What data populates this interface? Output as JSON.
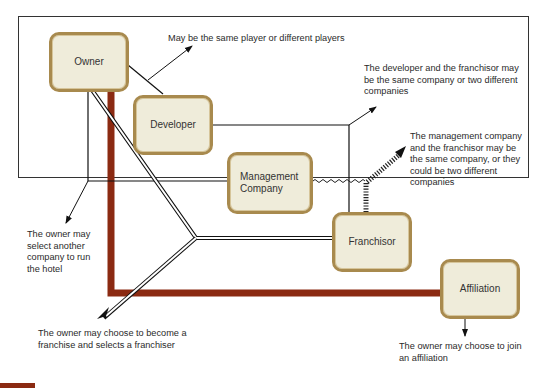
{
  "diagram": {
    "nodes": {
      "owner": "Owner",
      "developer": "Developer",
      "management": "Management Company",
      "franchisor": "Franchisor",
      "affiliation": "Affiliation"
    },
    "notes": {
      "same_player": "May be the same player or different players",
      "developer_franchisor": "The developer and the franchisor may be the same company or two different companies",
      "management_franchisor": "The management company and the franchisor may be the same company, or they could be two different companies",
      "select_company": "The owner may select another company to run the hotel",
      "franchise": "The owner may choose to become a franchise and selects a franchiser",
      "affiliation": "The owner may choose to join an affiliation"
    },
    "colors": {
      "node_fill": "#efecda",
      "node_border": "#a88a4e",
      "affiliation_path": "#8b2a12",
      "line": "#1a1a1a"
    }
  }
}
